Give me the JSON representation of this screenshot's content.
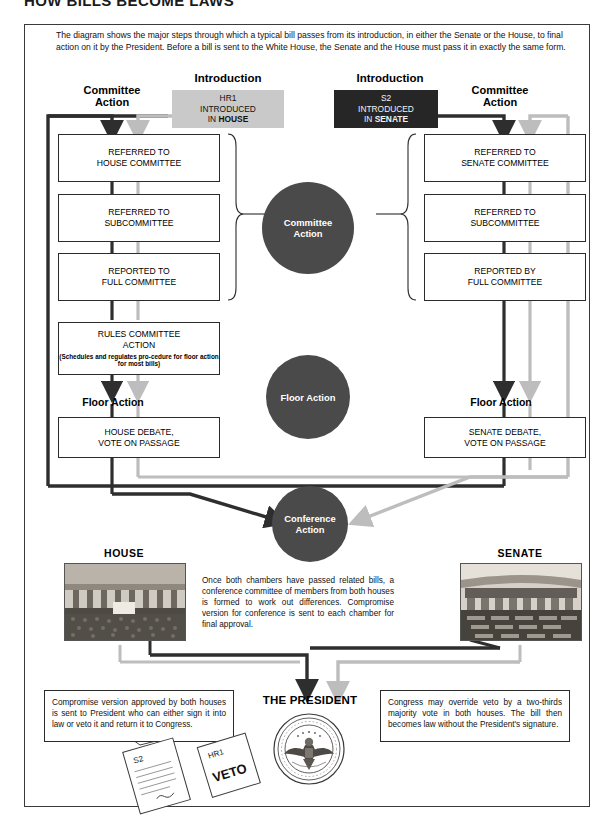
{
  "title": "HOW BILLS BECOME LAWS",
  "intro_paragraph": "The diagram shows the major steps through which a typical bill passes from its introduction, in either the Senate or the House, to final action on it by the President. Before a bill is sent to the White House, the Senate and the House must pass it in exactly the same form.",
  "labels": {
    "introduction_left": "Introduction",
    "introduction_right": "Introduction",
    "committee_action_left": "Committee\nAction",
    "committee_action_right": "Committee\nAction",
    "floor_action_left": "Floor Action",
    "floor_action_right": "Floor Action",
    "house_photo": "HOUSE",
    "senate_photo": "SENATE",
    "the_president": "THE PRESIDENT"
  },
  "intro_boxes": {
    "house": {
      "bill": "HR1",
      "line2": "INTRODUCED",
      "line3_prefix": "IN ",
      "line3_emph": "HOUSE",
      "fill": "#c9c9c9",
      "text_color": "#111111"
    },
    "senate": {
      "bill": "S2",
      "line2": "INTRODUCED",
      "line3_prefix": "IN ",
      "line3_emph": "SENATE",
      "fill": "#262626",
      "text_color": "#f2f2f2"
    }
  },
  "house_track": [
    {
      "line1": "REFERRED TO",
      "line2": "HOUSE COMMITTEE",
      "note": ""
    },
    {
      "line1": "REFERRED TO",
      "line2": "SUBCOMMITTEE",
      "note": ""
    },
    {
      "line1": "REPORTED TO",
      "line2": "FULL COMMITTEE",
      "note": ""
    },
    {
      "line1": "RULES COMMITTEE",
      "line2": "ACTION",
      "note": "(Schedules and regulates pro-cedure for floor action for most bills)"
    }
  ],
  "senate_track": [
    {
      "line1": "REFERRED TO",
      "line2": "SENATE COMMITTEE",
      "note": ""
    },
    {
      "line1": "REFERRED TO",
      "line2": "SUBCOMMITTEE",
      "note": ""
    },
    {
      "line1": "REPORTED BY",
      "line2": "FULL COMMITTEE",
      "note": ""
    }
  ],
  "debate_boxes": {
    "house": {
      "line1": "HOUSE DEBATE,",
      "line2": "VOTE ON PASSAGE"
    },
    "senate": {
      "line1": "SENATE DEBATE,",
      "line2": "VOTE ON PASSAGE"
    }
  },
  "circles": {
    "committee_action": "Committee\nAction",
    "floor_action": "Floor Action",
    "conference_action": "Conference\nAction"
  },
  "conference_note": "Once both chambers have passed related bills, a conference committee of members from both houses is formed to work out differences. Compromise version for conference is sent to each chamber for final approval.",
  "bottom_boxes": {
    "left": "Compromise version approved by both houses is sent to President who can either sign it into law or veto it and return it to Congress.",
    "right": "Congress may override veto by a two-thirds majority vote in both houses. The bill then becomes law without the President's signature."
  },
  "papers": {
    "bill_paper_label": "S2",
    "veto_paper_label_top": "HR1",
    "veto_paper_label_stamp": "VETO"
  },
  "seal": {
    "ring_text_top": "SEAL OF THE PRESIDENT OF THE UNITED STATES"
  },
  "colors": {
    "house_path": "#2e2e2e",
    "senate_path": "#bdbdbd",
    "circle_fill": "#4a4a4a",
    "intro_house_fill": "#c9c9c9",
    "intro_senate_fill": "#262626",
    "box_border": "#2b2b2b",
    "frame_border": "#3a3a3a"
  }
}
